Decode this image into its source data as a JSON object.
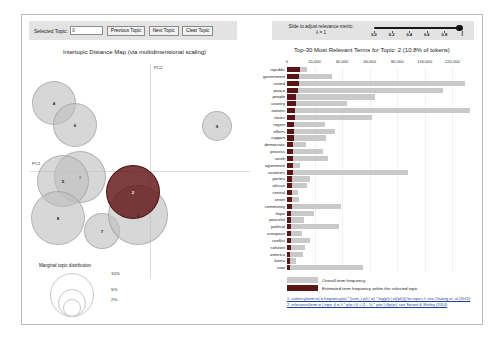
{
  "controls": {
    "selected_topic_label": "Selected Topic:",
    "selected_topic_value": "0",
    "previous_topic_label": "Previous Topic",
    "next_topic_label": "Next Topic",
    "clear_topic_label": "Clear Topic",
    "slider_label": "Slide to adjust relevance metric:",
    "lambda_label": "λ = 1",
    "slider_ticks": [
      "0.0",
      "0.2",
      "0.4",
      "0.6",
      "0.8",
      "1"
    ],
    "slider_value": 1
  },
  "map": {
    "title": "Intertopic Distance Map (via multidimensional scaling)",
    "axis_x": "PC1",
    "axis_y": "PC2",
    "selected_topic": 2,
    "topics": [
      {
        "id": 4,
        "cx": 26,
        "cy": 45,
        "r": 22,
        "selected": false
      },
      {
        "id": 6,
        "cx": 47,
        "cy": 67,
        "r": 22,
        "selected": false
      },
      {
        "id": 9,
        "cx": 189,
        "cy": 68,
        "r": 15,
        "selected": false
      },
      {
        "id": 3,
        "cx": 52,
        "cy": 119,
        "r": 26,
        "selected": false
      },
      {
        "id": 5,
        "cx": 35,
        "cy": 123,
        "r": 26,
        "selected": false
      },
      {
        "id": 8,
        "cx": 30,
        "cy": 160,
        "r": 27,
        "selected": false
      },
      {
        "id": 7,
        "cx": 74,
        "cy": 173,
        "r": 18,
        "selected": false
      },
      {
        "id": 1,
        "cx": 110,
        "cy": 157,
        "r": 30,
        "selected": false
      },
      {
        "id": 2,
        "cx": 105,
        "cy": 134,
        "r": 27,
        "selected": true
      }
    ],
    "marginal": {
      "title": "Marginal topic distribution",
      "sizes": [
        {
          "label": "2%",
          "r": 8
        },
        {
          "label": "5%",
          "r": 13
        },
        {
          "label": "10%",
          "r": 21
        }
      ]
    }
  },
  "chart_data": {
    "type": "bar",
    "title": "Top-30 Most Relevant Terms for Topic: 2 (10.8% of tokens)",
    "orientation": "horizontal",
    "xlabel": "",
    "ylabel": "",
    "xlim": [
      0,
      135000
    ],
    "xticks": [
      0,
      20000,
      40000,
      60000,
      80000,
      100000,
      120000
    ],
    "xtick_labels": [
      "0",
      "20,000",
      "40,000",
      "60,000",
      "80,000",
      "100,000",
      "120,000"
    ],
    "grid": true,
    "legend_position": "bottom-left",
    "series": [
      {
        "name": "Overall term frequency",
        "color": "#c9c9c9"
      },
      {
        "name": "Estimated term frequency within the selected topic",
        "color": "#5c1515"
      }
    ],
    "categories": [
      "republic",
      "government",
      "united",
      "peace",
      "people",
      "country",
      "nations",
      "states",
      "region",
      "efforts",
      "support",
      "democratic",
      "process",
      "south",
      "agreement",
      "countries",
      "parties",
      "african",
      "central",
      "union",
      "community",
      "hope",
      "peaceful",
      "political",
      "european",
      "conflict",
      "solution",
      "america",
      "korea",
      "now"
    ],
    "overall": [
      14500,
      32600,
      129000,
      113000,
      64000,
      43200,
      133000,
      62000,
      27500,
      34800,
      28000,
      13800,
      26200,
      30000,
      9500,
      88000,
      17000,
      14300,
      8000,
      9000,
      39500,
      19500,
      12500,
      37500,
      11000,
      16800,
      13200,
      11500,
      6200,
      55000
    ],
    "topic": [
      9400,
      8800,
      8400,
      8000,
      6400,
      6200,
      5900,
      5700,
      5300,
      5100,
      4900,
      4600,
      4400,
      4200,
      4100,
      4000,
      3800,
      3600,
      3500,
      3400,
      3300,
      3100,
      3000,
      2900,
      2800,
      2700,
      2600,
      2400,
      2300,
      2200
    ]
  },
  "legend": {
    "overall_label": "Overall term frequency",
    "topic_label": "Estimated term frequency within the selected topic"
  },
  "footnotes": [
    "1. saliency(term w) = frequency(w) * [sum_t p(t | w) * log(p(t | w)/p(t))] for topics t; see Chuang et. al (2012)",
    "2. relevance(term w | topic t) = λ * p(w | t) + (1 - λ) * p(w | t)/p(w); see Sievert & Shirley (2014)"
  ],
  "colors": {
    "bar_overall": "#c9c9c9",
    "bar_topic": "#5c1515",
    "bubble": "#bebebe",
    "bubble_selected": "#5f1414",
    "control_bg": "#e3e3e3",
    "link": "#1a3f8f"
  }
}
